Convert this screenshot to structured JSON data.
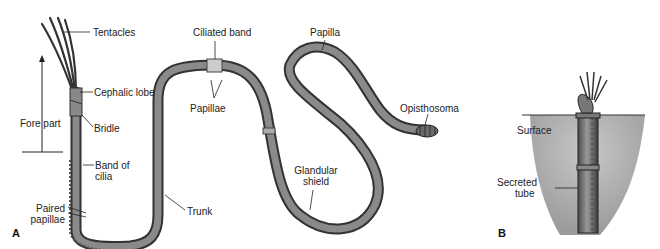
{
  "figure": {
    "panels": [
      {
        "id": "A",
        "label": "A"
      },
      {
        "id": "B",
        "label": "B"
      }
    ],
    "panel_a_labels": {
      "tentacles": "Tentacles",
      "cephalic_lobe": "Cephalic lobe",
      "fore_part": "Fore part",
      "bridle": "Bridle",
      "band_of_cilia_line1": "Band of",
      "band_of_cilia_line2": "cilia",
      "paired_papillae_line1": "Paired",
      "paired_papillae_line2": "papillae",
      "trunk": "Trunk",
      "ciliated_band": "Ciliated band",
      "papillae": "Papillae",
      "papilla": "Papilla",
      "glandular_shield_line1": "Glandular",
      "glandular_shield_line2": "shield",
      "opisthosoma": "Opisthosoma"
    },
    "panel_b_labels": {
      "surface": "Surface",
      "secreted_tube_line1": "Secreted",
      "secreted_tube_line2": "tube"
    },
    "colors": {
      "body": "#7a7a7a",
      "body_dark": "#3a3a3a",
      "sediment": "#b5b5b5",
      "line": "#222222"
    }
  }
}
